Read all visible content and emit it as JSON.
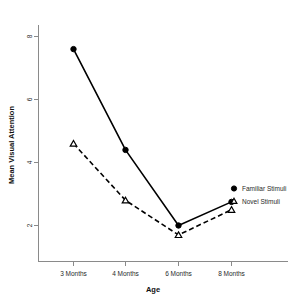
{
  "chart_data": {
    "type": "line",
    "title": "",
    "xlabel": "Age",
    "ylabel": "Mean Visual Attention",
    "categories": [
      "3 Months",
      "4 Months",
      "6 Months",
      "8 Months"
    ],
    "ylim": [
      0.9,
      8.6
    ],
    "yticks": [
      2,
      4,
      6,
      8
    ],
    "ytick_labels": [
      "2",
      "4",
      "6",
      "8"
    ],
    "grid": false,
    "legend_position": "inline-right",
    "series": [
      {
        "name": "Familiar Stimuli",
        "marker": "filled-circle",
        "line_style": "solid",
        "color": "#000000",
        "values": [
          7.6,
          4.4,
          2.0,
          2.75
        ]
      },
      {
        "name": "Novel Stimuli",
        "marker": "open-triangle",
        "line_style": "dashed",
        "color": "#000000",
        "values": [
          4.6,
          2.8,
          1.7,
          2.5
        ]
      }
    ]
  },
  "axes": {
    "y_title": "Mean Visual Attention",
    "x_title": "Age",
    "ytick_0": "2",
    "ytick_1": "4",
    "ytick_2": "6",
    "ytick_3": "8",
    "xtick_0": "3 Months",
    "xtick_1": "4 Months",
    "xtick_2": "6 Months",
    "xtick_3": "8 Months"
  },
  "legend": {
    "entry_0": "Familiar Stimuli",
    "entry_1": "Novel Stimuli"
  }
}
